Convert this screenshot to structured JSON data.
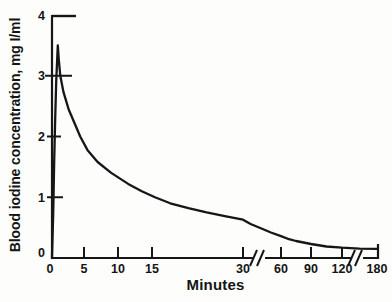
{
  "chart_data": {
    "type": "line",
    "title": "",
    "xlabel": "Minutes",
    "ylabel": "Blood iodine concentration, mg I/ml",
    "x_ticks": [
      0,
      5,
      10,
      15,
      30,
      60,
      90,
      120,
      180
    ],
    "x_tick_labels": [
      "0",
      "5",
      "10",
      "15",
      "30",
      "60",
      "90",
      "120",
      "180"
    ],
    "y_ticks": [
      0,
      1,
      2,
      3,
      4
    ],
    "y_tick_labels": [
      "0",
      "1",
      "2",
      "3",
      "4"
    ],
    "xlim": [
      0,
      180
    ],
    "ylim": [
      0,
      4
    ],
    "x_axis_breaks": [
      [
        30,
        60
      ],
      [
        120,
        180
      ]
    ],
    "grid": false,
    "legend": null,
    "line_color": "#161616",
    "background": "#fdfdfc",
    "series": [
      {
        "name": "blood iodine concentration",
        "points": [
          [
            0,
            0
          ],
          [
            0.2,
            0.8
          ],
          [
            0.35,
            1.6
          ],
          [
            0.5,
            2.3
          ],
          [
            0.65,
            2.9
          ],
          [
            0.9,
            3.5
          ],
          [
            1.05,
            3.28
          ],
          [
            1.3,
            3.0
          ],
          [
            1.8,
            2.73
          ],
          [
            2.6,
            2.45
          ],
          [
            3.6,
            2.2
          ],
          [
            4.4,
            2.0
          ],
          [
            5.5,
            1.78
          ],
          [
            7,
            1.58
          ],
          [
            9,
            1.4
          ],
          [
            11.5,
            1.22
          ],
          [
            13.5,
            1.1
          ],
          [
            15.5,
            1.0
          ],
          [
            18,
            0.9
          ],
          [
            21,
            0.82
          ],
          [
            24,
            0.75
          ],
          [
            27,
            0.69
          ],
          [
            30,
            0.63
          ],
          [
            36,
            0.56
          ],
          [
            45,
            0.48
          ],
          [
            52,
            0.42
          ],
          [
            60,
            0.36
          ],
          [
            68,
            0.31
          ],
          [
            75,
            0.28
          ],
          [
            90,
            0.23
          ],
          [
            105,
            0.19
          ],
          [
            120,
            0.17
          ],
          [
            150,
            0.155
          ],
          [
            180,
            0.15
          ]
        ]
      }
    ]
  }
}
